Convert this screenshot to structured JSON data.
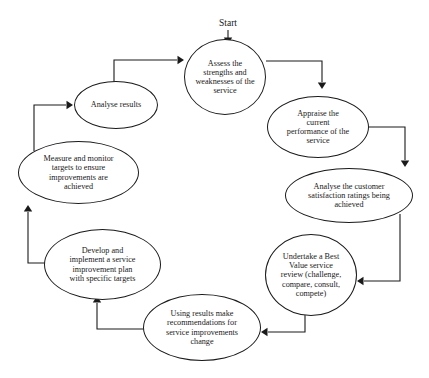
{
  "diagram": {
    "type": "cycle-flowchart",
    "background_color": "#ffffff",
    "line_color": "#1a1a1a",
    "start": {
      "label": "Start",
      "x": 228,
      "y": 25,
      "font_size": 9.5
    },
    "nodes": [
      {
        "id": "assess",
        "label": "Assess the\nstrengths and\nweaknesses of the\nservice",
        "x": 184,
        "y": 39,
        "w": 82,
        "h": 76,
        "font_size": 8.2
      },
      {
        "id": "appraise",
        "label": "Appraise the\ncurrent\nperformance of the\nservice",
        "x": 267,
        "y": 96,
        "w": 102,
        "h": 62,
        "font_size": 8.2
      },
      {
        "id": "analyse-customer",
        "label": "Analyse the customer\nsatisfaction ratings being\nachieved",
        "x": 285,
        "y": 168,
        "w": 128,
        "h": 55,
        "font_size": 8.2
      },
      {
        "id": "undertake",
        "label": "Undertake a Best\nValue service\nreview (challenge,\ncompare, consult,\ncompete)",
        "x": 265,
        "y": 234,
        "w": 92,
        "h": 82,
        "font_size": 8.2
      },
      {
        "id": "using-results",
        "label": "Using results make\nrecommendations for\nservice improvements\nchange",
        "x": 143,
        "y": 294,
        "w": 118,
        "h": 67,
        "font_size": 8.2
      },
      {
        "id": "develop",
        "label": "Develop and\nimplement a service\nimprovement plan\nwith specific targets",
        "x": 44,
        "y": 229,
        "w": 117,
        "h": 71,
        "font_size": 8.2
      },
      {
        "id": "measure",
        "label": "Measure and monitor\ntargets to ensure\nimprovements are\nachieved",
        "x": 18,
        "y": 141,
        "w": 121,
        "h": 63,
        "font_size": 8.2
      },
      {
        "id": "analyse-results",
        "label": "Analyse results",
        "x": 74,
        "y": 81,
        "w": 84,
        "h": 48,
        "font_size": 8.2
      }
    ],
    "edges": [
      {
        "id": "start-to-assess",
        "from": "start",
        "to": "assess",
        "path": "M 228 30 L 228 40",
        "arrow": {
          "x": 228,
          "y": 44,
          "dir": "down"
        }
      },
      {
        "id": "assess-to-appraise",
        "from": "assess",
        "to": "appraise",
        "path": "M 266 61 L 322 61 L 322 82",
        "arrow": {
          "x": 322,
          "y": 89,
          "dir": "down"
        }
      },
      {
        "id": "appraise-to-analyse-customer",
        "from": "appraise",
        "to": "analyse-customer",
        "path": "M 369 127 L 405 127 L 405 160",
        "arrow": {
          "x": 405,
          "y": 167,
          "dir": "down"
        }
      },
      {
        "id": "analyse-customer-to-undertake",
        "from": "analyse-customer",
        "to": "undertake",
        "path": "M 400 214 L 400 281 L 364 281",
        "arrow": {
          "x": 357,
          "y": 281,
          "dir": "left"
        }
      },
      {
        "id": "undertake-to-using-results",
        "from": "undertake",
        "to": "using-results",
        "path": "M 305 314 L 305 332 L 268 332",
        "arrow": {
          "x": 261,
          "y": 332,
          "dir": "left"
        }
      },
      {
        "id": "using-results-to-develop",
        "from": "using-results",
        "to": "develop",
        "path": "M 148 329 L 97 329 L 97 303",
        "arrow": {
          "x": 97,
          "y": 296,
          "dir": "up"
        }
      },
      {
        "id": "develop-to-measure",
        "from": "develop",
        "to": "measure",
        "path": "M 50 263 L 28 263 L 28 212",
        "arrow": {
          "x": 28,
          "y": 205,
          "dir": "up"
        }
      },
      {
        "id": "measure-to-analyse-results",
        "from": "measure",
        "to": "analyse-results",
        "path": "M 34 151 L 34 105 L 66 105",
        "arrow": {
          "x": 73,
          "y": 105,
          "dir": "right"
        }
      },
      {
        "id": "analyse-results-to-assess",
        "from": "analyse-results",
        "to": "assess",
        "path": "M 114 82 L 114 60 L 177 60",
        "arrow": {
          "x": 184,
          "y": 60,
          "dir": "right"
        }
      }
    ]
  }
}
